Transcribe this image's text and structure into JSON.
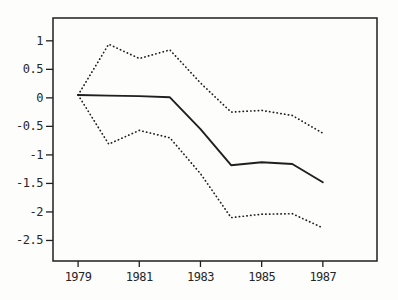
{
  "chart_data": {
    "type": "line",
    "title": "",
    "xlabel": "",
    "ylabel": "",
    "x": [
      1979,
      1980,
      1981,
      1982,
      1983,
      1984,
      1985,
      1986,
      1987
    ],
    "series": [
      {
        "name": "point-estimate",
        "style": "solid",
        "values": [
          0.05,
          0.04,
          0.03,
          0.01,
          -0.55,
          -1.18,
          -1.13,
          -1.16,
          -1.48
        ]
      },
      {
        "name": "upper-band",
        "style": "dotted",
        "values": [
          0.05,
          0.94,
          0.69,
          0.84,
          0.26,
          -0.25,
          -0.22,
          -0.31,
          -0.62
        ]
      },
      {
        "name": "lower-band",
        "style": "dotted",
        "values": [
          0.05,
          -0.81,
          -0.57,
          -0.7,
          -1.33,
          -2.1,
          -2.04,
          -2.03,
          -2.28
        ]
      }
    ],
    "x_ticks": [
      1979,
      1981,
      1983,
      1985,
      1987
    ],
    "x_tick_labels": [
      "1979",
      "1981",
      "1983",
      "1985",
      "1987"
    ],
    "y_ticks": [
      1,
      0.5,
      0,
      -0.5,
      -1,
      -1.5,
      -2,
      -2.5
    ],
    "y_tick_labels": [
      "1",
      "0.5",
      "0",
      "-0.5",
      "-1",
      "-1.5",
      "-2",
      "-2.5"
    ],
    "xlim": [
      1978.18,
      1988.77
    ],
    "ylim": [
      -2.86,
      1.4
    ],
    "grid": false,
    "legend": null,
    "frame": true,
    "line_color": "#1f1f1f",
    "text_color": "#262626",
    "background": "#fdfdfc"
  }
}
